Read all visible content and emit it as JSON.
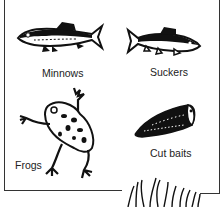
{
  "figure": {
    "items": [
      {
        "id": "minnows",
        "label": "Minnows",
        "icon": "minnow-fish-icon"
      },
      {
        "id": "suckers",
        "label": "Suckers",
        "icon": "sucker-fish-icon"
      },
      {
        "id": "frogs",
        "label": "Frogs",
        "icon": "frog-icon"
      },
      {
        "id": "cut-baits",
        "label": "Cut baits",
        "icon": "cut-bait-icon"
      }
    ],
    "decoration": "grass-icon",
    "colors": {
      "ink": "#1a1a1a",
      "background": "#ffffff"
    }
  }
}
